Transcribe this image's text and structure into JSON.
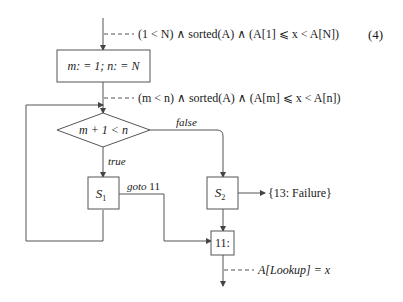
{
  "equation_number": "(4)",
  "annotations": {
    "precondition": "(1 < N) ∧ sorted(A) ∧ (A[1] ⩽ x < A[N])",
    "invariant": "(m < n) ∧ sorted(A) ∧ (A[m] ⩽ x < A[n])",
    "postcondition": "A[Lookup] = x"
  },
  "nodes": {
    "init": "m: = 1;   n: = N",
    "condition": "m + 1 < n",
    "s1_base": "S",
    "s1_sub": "1",
    "s2_base": "S",
    "s2_sub": "2",
    "label11": "11:"
  },
  "edges": {
    "true_label": "true",
    "false_label": "false",
    "goto_label_word": "goto",
    "goto_label_num": "11",
    "failure_label": "{13: Failure}"
  },
  "colors": {
    "line": "#555555",
    "text": "#1a1a1a",
    "background": "#ffffff"
  }
}
